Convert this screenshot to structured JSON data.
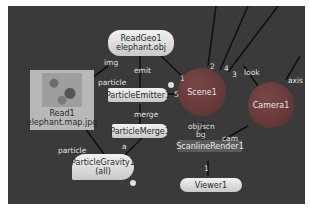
{
  "nodes": {
    "readgeo": {
      "line1": "ReadGeo1",
      "line2": "elephant.obj"
    },
    "read": {
      "line1": "Read1",
      "line2": "elephant.map.jpg"
    },
    "emitter": {
      "label": "ParticleEmitter1"
    },
    "merge": {
      "label": "ParticleMerge1"
    },
    "gravity": {
      "line1": "ParticleGravity1",
      "line2": "(all)"
    },
    "scene": {
      "label": "Scene1"
    },
    "camera": {
      "label": "Camera1"
    },
    "render": {
      "label": "ScanlineRender1"
    },
    "viewer": {
      "label": "Viewer1"
    }
  },
  "edge_labels": {
    "img": "img",
    "emit": "emit",
    "particle_top": "particle",
    "merge": "merge",
    "particle_bottom": "particle",
    "a": "a",
    "in1": "1",
    "in2": "2",
    "in3": "3",
    "in4": "4",
    "in5": "5",
    "look": "look",
    "axis": "axis",
    "obj_scn": "obj/scn",
    "bg": "bg",
    "cam": "cam",
    "viewer_in": "1"
  },
  "colors": {
    "canvas": "#3a3a3a",
    "scene_node": "#5a3030",
    "edge": "#111111"
  }
}
